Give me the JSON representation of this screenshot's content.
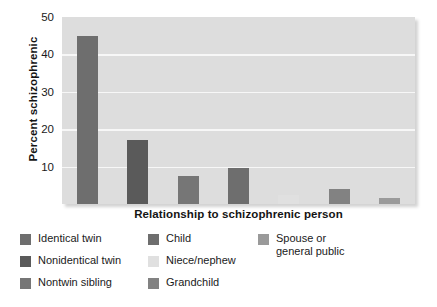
{
  "chart_data": {
    "type": "bar",
    "title": "",
    "xlabel": "Relationship to schizophrenic person",
    "ylabel": "Percent schizophrenic",
    "categories": [
      "Identical twin",
      "Nonidentical twin",
      "Nontwin sibling",
      "Child",
      "Niece/nephew",
      "Grandchild",
      "Spouse or general public"
    ],
    "values": [
      45,
      17,
      7.5,
      9.5,
      2.5,
      4,
      1.5
    ],
    "ylim": [
      0,
      50
    ],
    "xlim_note": "categorical",
    "yticks": [
      10,
      20,
      30,
      40,
      50
    ],
    "ytick_labels": [
      "10",
      "20",
      "30",
      "40",
      "50"
    ],
    "grid": "horizontal",
    "legend_position": "below-plot",
    "plot_background": "#dddddd",
    "gridline_color": "#f7f7f7",
    "bar_colors": [
      "#6e6e6e",
      "#5a5a5a",
      "#767676",
      "#6e6e6e",
      "#e0e0e0",
      "#828282",
      "#9a9a9a"
    ]
  },
  "axes": {
    "y_title": "Percent schizophrenic",
    "x_title": "Relationship to schizophrenic person",
    "y_ticks": [
      {
        "label": "50",
        "value": 50
      },
      {
        "label": "40",
        "value": 40
      },
      {
        "label": "30",
        "value": 30
      },
      {
        "label": "20",
        "value": 20
      },
      {
        "label": "10",
        "value": 10
      }
    ]
  },
  "legend": {
    "columns": [
      {
        "items": [
          {
            "label": "Identical twin",
            "color": "#6e6e6e"
          },
          {
            "label": "Nonidentical twin",
            "color": "#5a5a5a"
          },
          {
            "label": "Nontwin sibling",
            "color": "#767676"
          }
        ]
      },
      {
        "items": [
          {
            "label": "Child",
            "color": "#6e6e6e"
          },
          {
            "label": "Niece/nephew",
            "color": "#e0e0e0"
          },
          {
            "label": "Grandchild",
            "color": "#828282"
          }
        ]
      },
      {
        "items": [
          {
            "label": "Spouse or\ngeneral public",
            "color": "#9a9a9a"
          }
        ]
      }
    ]
  }
}
